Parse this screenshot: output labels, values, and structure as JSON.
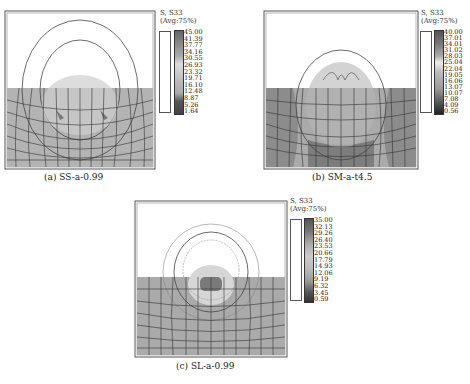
{
  "figure": {
    "panels": [
      {
        "id": "a",
        "caption": "(a) SS-a-0.99",
        "legend_title_1": "S, S33",
        "legend_title_2": "(Avg:75%)",
        "legend_values": [
          "45.00",
          "41.39",
          "37.77",
          "34.16",
          "30.55",
          "26.93",
          "23.32",
          "19.71",
          "16.10",
          "12.48",
          "8.87",
          "5.26",
          "1.64"
        ]
      },
      {
        "id": "b",
        "caption": "(b) SM-a-t4.5",
        "legend_title_1": "S, S33",
        "legend_title_2": "(Avg:75%)",
        "legend_values": [
          "40.00",
          "37.01",
          "34.01",
          "31.02",
          "28.03",
          "25.04",
          "22.04",
          "19.05",
          "16.06",
          "13.07",
          "10.07",
          "7.08",
          "4.09",
          "0.56"
        ]
      },
      {
        "id": "c",
        "caption": "(c) SL-a-0.99",
        "legend_title_1": "S, S33",
        "legend_title_2": "(Avg:75%)",
        "legend_values": [
          "35.00",
          "32.13",
          "29.26",
          "26.40",
          "23.53",
          "20.66",
          "17.79",
          "14.93",
          "12.06",
          "9.19",
          "6.32",
          "3.45",
          "0.59"
        ]
      }
    ],
    "colors": {
      "mesh_fill_light": "#bdbdbd",
      "mesh_fill_mid": "#a8a8a8",
      "mesh_fill_dark": "#7a7a7a",
      "grid_line": "#333333",
      "contour": "#555555"
    }
  }
}
